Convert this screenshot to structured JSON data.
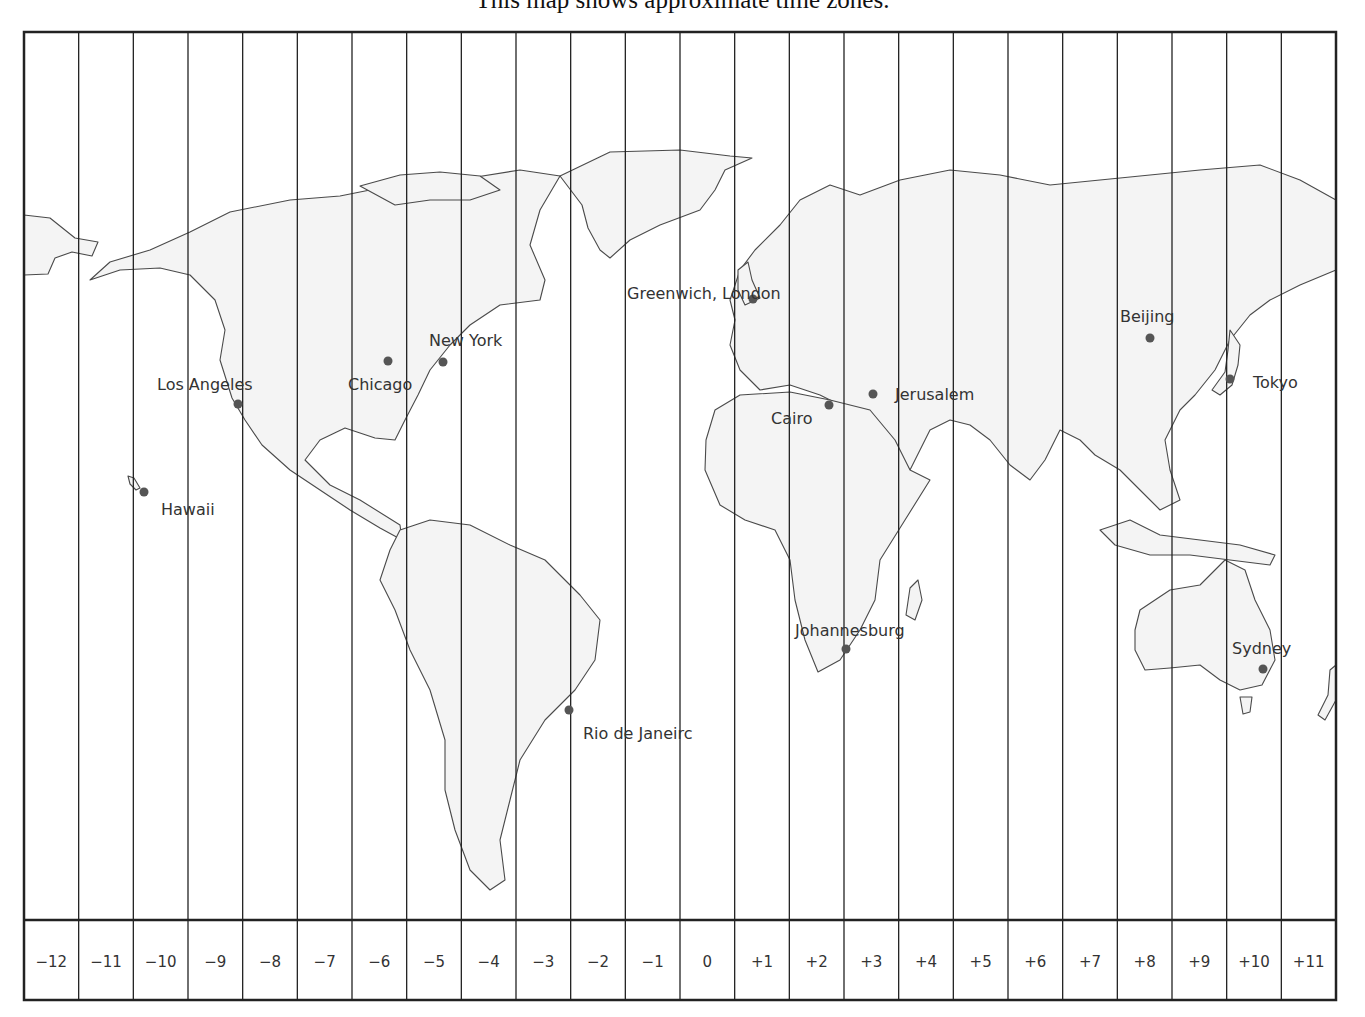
{
  "title": "This map shows approximate time zones.",
  "colors": {
    "background": "#ffffff",
    "land_fill": "#f4f4f4",
    "land_stroke": "#4a4a4a",
    "grid_line": "#222222",
    "city_dot": "#555555",
    "text": "#333333"
  },
  "time_zones": [
    "−12",
    "−11",
    "−10",
    "−9",
    "−8",
    "−7",
    "−6",
    "−5",
    "−4",
    "−3",
    "−2",
    "−1",
    "0",
    "+1",
    "+2",
    "+3",
    "+4",
    "+5",
    "+6",
    "+7",
    "+8",
    "+9",
    "+10",
    "+11"
  ],
  "cities": [
    {
      "name": "Hawaii",
      "utc_offset": -10
    },
    {
      "name": "Los Angeles",
      "utc_offset": -8
    },
    {
      "name": "Chicago",
      "utc_offset": -6
    },
    {
      "name": "New York",
      "utc_offset": -5
    },
    {
      "name": "Rio de Janeirc",
      "utc_offset": -3
    },
    {
      "name": "Greenwich, London",
      "utc_offset": 0
    },
    {
      "name": "Cairo",
      "utc_offset": 2
    },
    {
      "name": "Johannesburg",
      "utc_offset": 2
    },
    {
      "name": "Jerusalem",
      "utc_offset": 2
    },
    {
      "name": "Beijing",
      "utc_offset": 8
    },
    {
      "name": "Tokyo",
      "utc_offset": 9
    },
    {
      "name": "Sydney",
      "utc_offset": 10
    }
  ]
}
